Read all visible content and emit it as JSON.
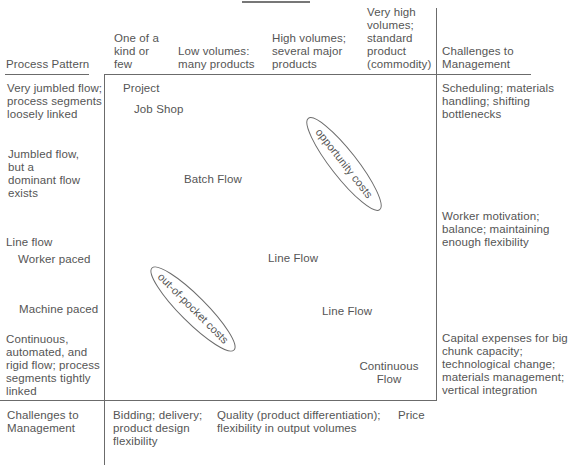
{
  "header": {
    "column_headers": [
      {
        "label": "One of a\nkind or\nfew"
      },
      {
        "label": "Low volumes:\nmany products"
      },
      {
        "label": "High volumes;\nseveral major\nproducts"
      },
      {
        "label": "Very high\nvolumes;\nstandard\nproduct\n(commodity)"
      }
    ],
    "right_header": "Challenges to\nManagement",
    "row_axis_title": "Process Pattern"
  },
  "rows": [
    {
      "label": "Very jumbled flow;\nprocess segments\nloosely linked",
      "challenge": "Scheduling; materials\nhandling; shifting\nbottlenecks"
    },
    {
      "label": "Jumbled flow,\nbut a\ndominant flow\nexists",
      "challenge": ""
    },
    {
      "label": "Line flow",
      "challenge": "Worker motivation;\nbalance; maintaining\nenough flexibility"
    },
    {
      "label": "Worker paced",
      "challenge": ""
    },
    {
      "label": "Machine paced",
      "challenge": ""
    },
    {
      "label": "Continuous,\nautomated, and\nrigid flow; process\nsegments tightly\nlinked",
      "challenge": "Capital expenses for big\nchunk capacity;\ntechnological change;\nmaterials management;\nvertical integration"
    }
  ],
  "matrix": {
    "items": [
      {
        "label": "Project"
      },
      {
        "label": "Job Shop"
      },
      {
        "label": "Batch Flow"
      },
      {
        "label": "Line Flow"
      },
      {
        "label": "Line Flow"
      },
      {
        "label": "Continuous\nFlow"
      }
    ],
    "ellipses": [
      {
        "label": "opportunity costs"
      },
      {
        "label": "out-of-pocket costs"
      }
    ]
  },
  "footer": {
    "left_label": "Challenges to\nManagement",
    "columns": [
      {
        "label": "Bidding; delivery;\nproduct design\nflexibility"
      },
      {
        "label": "Quality (product differentiation);\nflexibility in output volumes"
      },
      {
        "label": "Price"
      }
    ]
  },
  "colors": {
    "text": "#555555",
    "line": "#6b6b6b",
    "background": "#ffffff"
  }
}
